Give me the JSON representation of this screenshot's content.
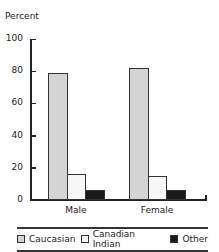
{
  "chart_data": {
    "type": "bar",
    "title": "",
    "xlabel": "",
    "ylabel": "Percent",
    "ylim": [
      0,
      100
    ],
    "yticks": [
      0,
      20,
      40,
      60,
      80,
      100
    ],
    "categories": [
      "Male",
      "Female"
    ],
    "series": [
      {
        "name": "Caucasian",
        "color": "#d4d4d4",
        "values": [
          79,
          82
        ]
      },
      {
        "name": "Canadian Indian",
        "color": "#f7f7f7",
        "values": [
          16,
          15
        ]
      },
      {
        "name": "Other",
        "color": "#1a1a1a",
        "values": [
          6,
          6
        ]
      }
    ],
    "grid": false,
    "legend_position": "bottom"
  },
  "axis": {
    "ylabel": "Percent",
    "ticks": [
      "0",
      "20",
      "40",
      "60",
      "80",
      "100"
    ]
  },
  "categories": [
    "Male",
    "Female"
  ],
  "legend": [
    {
      "label": "Caucasian",
      "color": "#d4d4d4"
    },
    {
      "label": "Canadian Indian",
      "color": "#f7f7f7"
    },
    {
      "label": "Other",
      "color": "#1a1a1a"
    }
  ]
}
